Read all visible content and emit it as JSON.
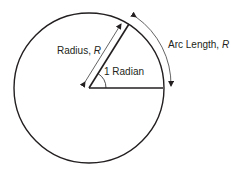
{
  "diagram": {
    "labels": {
      "radius": "Radius, ",
      "radius_var": "R",
      "angle": "1 Radian",
      "arc": "Arc Length, ",
      "arc_var": "R"
    },
    "colors": {
      "stroke": "#231f20",
      "background": "#ffffff"
    }
  }
}
